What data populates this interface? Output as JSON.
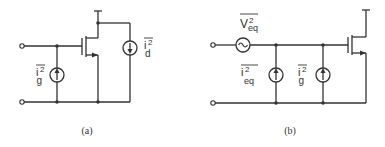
{
  "diagram": {
    "type": "MOSFET noise equivalent circuits",
    "colors": {
      "stroke": "#333333",
      "background": "#ffffff"
    },
    "panel_a": {
      "caption": "(a)",
      "gate_noise_label": {
        "base": "i",
        "sup": "2",
        "sub": "g"
      },
      "drain_noise_label": {
        "base": "i",
        "sup": "2",
        "sub": "d"
      }
    },
    "panel_b": {
      "caption": "(b)",
      "voltage_noise_label": {
        "base": "V",
        "sup": "2",
        "sub": "eq"
      },
      "current_noise_label": {
        "base": "i",
        "sup": "2",
        "sub": "eq"
      },
      "gate_noise_label": {
        "base": "i",
        "sup": "2",
        "sub": "g"
      }
    }
  }
}
